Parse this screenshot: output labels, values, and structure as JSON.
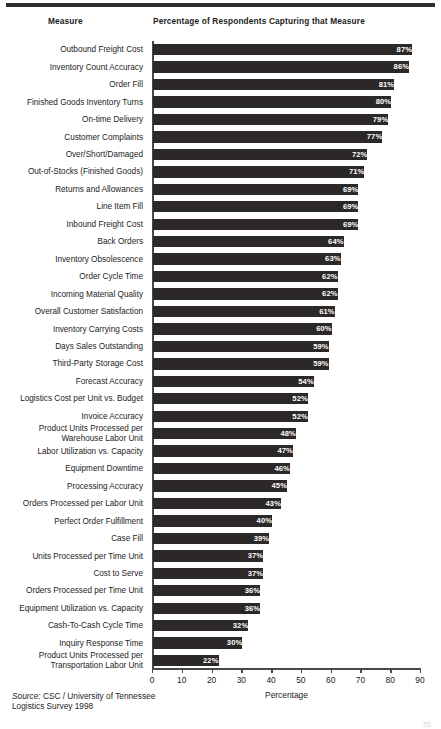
{
  "page": {
    "page_number": "55"
  },
  "headers": {
    "measure": "Measure",
    "percentage": "Percentage of Respondents Capturing that Measure"
  },
  "source": {
    "prefix": "Source:",
    "text": " CSC / University of Tennessee Logistics Survey 1998"
  },
  "chart_data": {
    "type": "bar",
    "orientation": "horizontal",
    "title": "Percentage of Respondents Capturing that Measure",
    "xlabel": "Percentage",
    "ylabel": "Measure",
    "xlim": [
      0,
      90
    ],
    "xticks": [
      0,
      10,
      20,
      30,
      40,
      50,
      60,
      70,
      80,
      90
    ],
    "grid": false,
    "legend": false,
    "bar_color": "#2b2827",
    "label_color": "#ffffff",
    "value_suffix": "%",
    "categories": [
      "Outbound Freight Cost",
      "Inventory Count Accuracy",
      "Order Fill",
      "Finished Goods Inventory Turns",
      "On-time Delivery",
      "Customer Complaints",
      "Over/Short/Damaged",
      "Out-of-Stocks (Finished Goods)",
      "Returns and Allowances",
      "Line Item Fill",
      "Inbound Freight Cost",
      "Back Orders",
      "Inventory Obsolescence",
      "Order Cycle Time",
      "Incoming Material Quality",
      "Overall Customer Satisfaction",
      "Inventory Carrying Costs",
      "Days Sales Outstanding",
      "Third-Party Storage Cost",
      "Forecast Accuracy",
      "Logistics Cost per Unit vs. Budget",
      "Invoice Accuracy",
      "Product Units Processed per\nWarehouse Labor Unit",
      "Labor Utilization vs. Capacity",
      "Equipment Downtime",
      "Processing Accuracy",
      "Orders Processed per Labor Unit",
      "Perfect Order Fulfillment",
      "Case Fill",
      "Units Processed per Time Unit",
      "Cost to Serve",
      "Orders Processed per Time Unit",
      "Equipment Utilization vs. Capacity",
      "Cash-To-Cash Cycle Time",
      "Inquiry Response Time",
      "Product Units Processed per\nTransportation Labor Unit"
    ],
    "values": [
      87,
      86,
      81,
      80,
      79,
      77,
      72,
      71,
      69,
      69,
      69,
      64,
      63,
      62,
      62,
      61,
      60,
      59,
      59,
      54,
      52,
      52,
      48,
      47,
      46,
      45,
      43,
      40,
      39,
      37,
      37,
      36,
      36,
      32,
      30,
      22
    ],
    "value_labels": [
      "87%",
      "86%",
      "81%",
      "80%",
      "79%",
      "77%",
      "72%",
      "71%",
      "69%",
      "69%",
      "69%",
      "64%",
      "63%",
      "62%",
      "62%",
      "61%",
      "60%",
      "59%",
      "59%",
      "54%",
      "52%",
      "52%",
      "48%",
      "47%",
      "46%",
      "45%",
      "43%",
      "40%",
      "39%",
      "37%",
      "37%",
      "36%",
      "36%",
      "32%",
      "30%",
      "22%"
    ]
  }
}
